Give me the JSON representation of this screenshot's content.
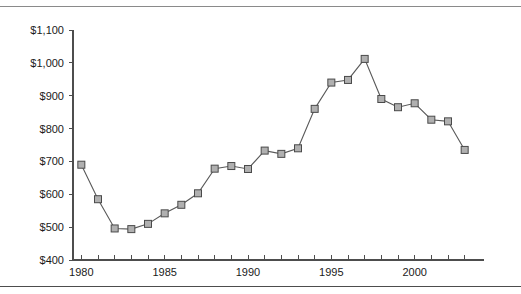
{
  "figure": {
    "has_top_rule": true,
    "has_bottom_rule": true,
    "rule_color": "#8a8a8a"
  },
  "chart_data": {
    "type": "line",
    "title": "",
    "subtitle": "",
    "xlabel": "",
    "ylabel": "",
    "x": [
      1980,
      1981,
      1982,
      1983,
      1984,
      1985,
      1986,
      1987,
      1988,
      1989,
      1990,
      1991,
      1992,
      1993,
      1994,
      1995,
      1996,
      1997,
      1998,
      1999,
      2000,
      2001,
      2002,
      2003
    ],
    "values": [
      690,
      585,
      496,
      494,
      510,
      542,
      568,
      603,
      678,
      686,
      677,
      733,
      723,
      740,
      860,
      940,
      948,
      1012,
      890,
      865,
      877,
      827,
      822,
      735
    ],
    "series": [
      {
        "name": "",
        "values": [
          690,
          585,
          496,
          494,
          510,
          542,
          568,
          603,
          678,
          686,
          677,
          733,
          723,
          740,
          860,
          940,
          948,
          1012,
          890,
          865,
          877,
          827,
          822,
          735
        ]
      }
    ],
    "xlim": [
      1979.5,
      2003.8
    ],
    "ylim": [
      400,
      1100
    ],
    "ytick_values": [
      400,
      500,
      600,
      700,
      800,
      900,
      1000,
      1100
    ],
    "ytick_labels": [
      "$400",
      "$500",
      "$600",
      "$700",
      "$800",
      "$900",
      "$1,000",
      "$1,100"
    ],
    "xtick_values": [
      1980,
      1985,
      1990,
      1995,
      2000
    ],
    "xtick_labels": [
      "1980",
      "1985",
      "1990",
      "1995",
      "2000"
    ],
    "xtick_minor_every": 1,
    "grid": false,
    "legend": null,
    "legend_position": "none",
    "marker": "square",
    "marker_fill": "#b0b0b0",
    "marker_edge": "#4a4a4a",
    "line_color": "#595959",
    "axis_color": "#4d4d4d",
    "background": "#ffffff"
  }
}
